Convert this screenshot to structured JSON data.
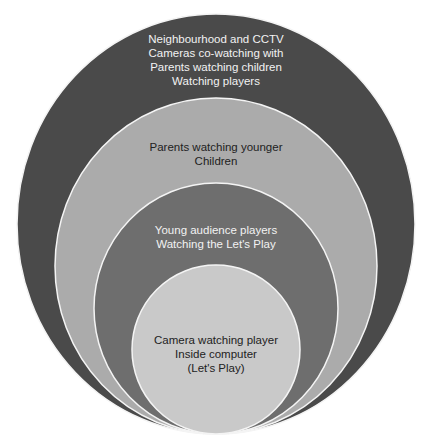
{
  "diagram": {
    "type": "nested-circles",
    "colors": {
      "background": "#ffffff",
      "stroke": "#f4f4f4",
      "ring1": "#4a4a4a",
      "ring2": "#ababab",
      "ring3": "#6e6e6e",
      "ring4": "#c9c9c9",
      "text_light": "#f2f2f2",
      "text_dark": "#222222"
    },
    "rings": [
      {
        "id": "outer",
        "label": "Neighbourhood and CCTV\nCameras co-watching with\nParents watching children\nWatching players"
      },
      {
        "id": "second",
        "label": "Parents watching younger\nChildren"
      },
      {
        "id": "third",
        "label": "Young audience players\nWatching the Let's Play"
      },
      {
        "id": "inner",
        "label": "Camera watching player\nInside computer\n(Let's Play)"
      }
    ]
  }
}
